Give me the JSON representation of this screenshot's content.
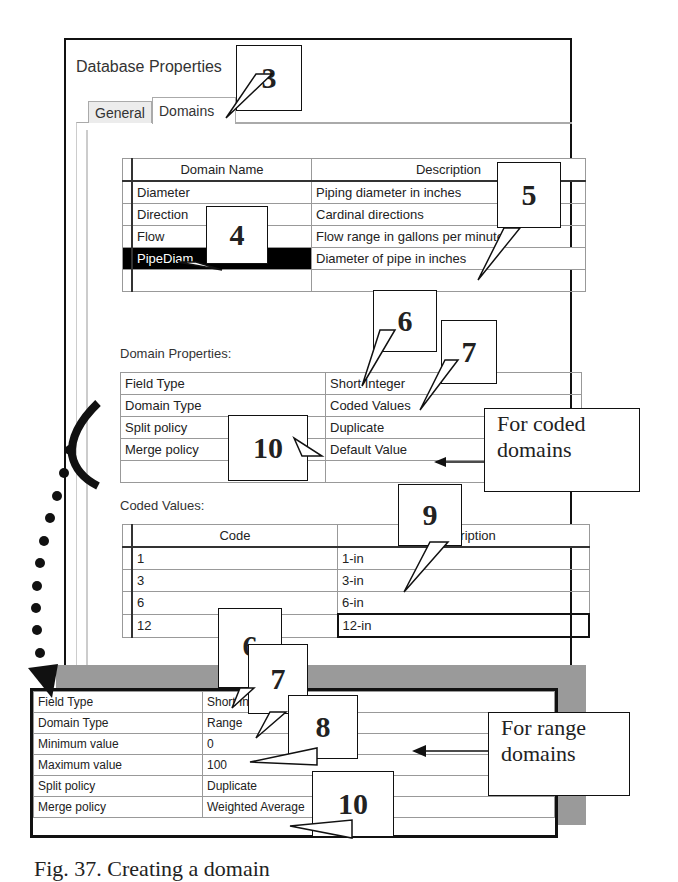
{
  "window": {
    "title": "Database Properties"
  },
  "tabs": [
    {
      "label": "General",
      "active": false
    },
    {
      "label": "Domains",
      "active": true
    }
  ],
  "domains_table": {
    "headers": [
      "Domain Name",
      "Description"
    ],
    "rows": [
      {
        "name": "Diameter",
        "description": "Piping diameter in inches",
        "selected": false
      },
      {
        "name": "Direction",
        "description": "Cardinal directions",
        "selected": false
      },
      {
        "name": "Flow",
        "description": "Flow range in gallons per minute",
        "selected": false
      },
      {
        "name": "PipeDiam",
        "description": "Diameter of pipe in inches",
        "selected": true
      },
      {
        "name": "",
        "description": "",
        "selected": false
      }
    ]
  },
  "domain_properties": {
    "label": "Domain Properties:",
    "rows": [
      {
        "property": "Field Type",
        "value": "Short Integer"
      },
      {
        "property": "Domain Type",
        "value": "Coded Values"
      },
      {
        "property": "Split policy",
        "value": "Duplicate"
      },
      {
        "property": "Merge policy",
        "value": "Default Value"
      },
      {
        "property": "",
        "value": ""
      }
    ]
  },
  "coded_values": {
    "label": "Coded Values:",
    "headers": [
      "Code",
      "Description"
    ],
    "rows": [
      {
        "code": "1",
        "description": "1-in"
      },
      {
        "code": "3",
        "description": "3-in"
      },
      {
        "code": "6",
        "description": "6-in"
      },
      {
        "code": "12",
        "description": "12-in"
      }
    ]
  },
  "range_properties": {
    "rows": [
      {
        "property": "Field Type",
        "value": "Short Integer"
      },
      {
        "property": "Domain Type",
        "value": "Range"
      },
      {
        "property": "Minimum value",
        "value": "0"
      },
      {
        "property": "Maximum value",
        "value": "100"
      },
      {
        "property": "Split policy",
        "value": "Duplicate"
      },
      {
        "property": "Merge policy",
        "value": "Weighted Average"
      }
    ]
  },
  "callouts": {
    "c3": "3",
    "c4": "4",
    "c5": "5",
    "c6a": "6",
    "c7a": "7",
    "c10a": "10",
    "c9": "9",
    "c6b": "6",
    "c7b": "7",
    "c8": "8",
    "c10b": "10"
  },
  "notes": {
    "coded": "For coded domains",
    "range": "For range domains"
  },
  "caption": "Fig. 37. Creating a domain"
}
